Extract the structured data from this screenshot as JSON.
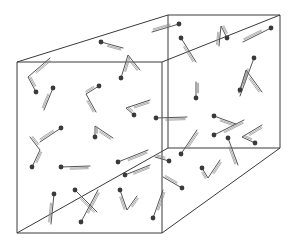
{
  "diagram": {
    "title": "",
    "colors": {
      "edge": "#3a3a3a",
      "stick": "#555555",
      "atom": "#3a3a3a",
      "background": "#ffffff"
    },
    "box": {
      "front": [
        [
          17,
          62
        ],
        [
          162,
          62
        ],
        [
          162,
          233
        ],
        [
          17,
          233
        ]
      ],
      "back": [
        [
          168,
          15
        ],
        [
          280,
          15
        ],
        [
          280,
          148
        ],
        [
          168,
          148
        ]
      ]
    },
    "molecules": [
      {
        "atom": [
          101,
          42
        ],
        "path": [
          [
            101,
            42
          ],
          [
            123,
            48
          ]
        ]
      },
      {
        "atom": [
          36,
          92
        ],
        "path": [
          [
            36,
            92
          ],
          [
            28,
            77
          ],
          [
            50,
            58
          ]
        ]
      },
      {
        "atom": [
          53,
          88
        ],
        "path": [
          [
            53,
            88
          ],
          [
            44,
            110
          ]
        ]
      },
      {
        "atom": [
          99,
          86
        ],
        "path": [
          [
            99,
            86
          ],
          [
            86,
            94
          ],
          [
            96,
            112
          ]
        ]
      },
      {
        "atom": [
          121,
          78
        ],
        "path": [
          [
            121,
            78
          ],
          [
            128,
            55
          ],
          [
            140,
            70
          ]
        ]
      },
      {
        "atom": [
          134,
          115
        ],
        "path": [
          [
            134,
            115
          ],
          [
            126,
            108
          ],
          [
            150,
            100
          ]
        ]
      },
      {
        "atom": [
          179,
          24
        ],
        "path": [
          [
            179,
            24
          ],
          [
            152,
            32
          ]
        ]
      },
      {
        "atom": [
          181,
          38
        ],
        "path": [
          [
            181,
            38
          ],
          [
            196,
            62
          ]
        ]
      },
      {
        "atom": [
          227,
          38
        ],
        "path": [
          [
            227,
            38
          ],
          [
            221,
            26
          ],
          [
            219,
            46
          ]
        ]
      },
      {
        "atom": [
          271,
          28
        ],
        "path": [
          [
            271,
            28
          ],
          [
            243,
            42
          ]
        ]
      },
      {
        "atom": [
          254,
          58
        ],
        "path": [
          [
            254,
            58
          ],
          [
            240,
            96
          ]
        ]
      },
      {
        "atom": [
          240,
          90
        ],
        "path": [
          [
            240,
            90
          ],
          [
            246,
            70
          ],
          [
            262,
            92
          ]
        ]
      },
      {
        "atom": [
          196,
          98
        ],
        "path": [
          [
            196,
            98
          ],
          [
            196,
            82
          ]
        ]
      },
      {
        "atom": [
          214,
          116
        ],
        "path": [
          [
            214,
            116
          ],
          [
            236,
            124
          ]
        ]
      },
      {
        "atom": [
          214,
          135
        ],
        "path": [
          [
            214,
            135
          ],
          [
            244,
            120
          ]
        ]
      },
      {
        "atom": [
          156,
          118
        ],
        "path": [
          [
            156,
            118
          ],
          [
            187,
            117
          ]
        ]
      },
      {
        "atom": [
          61,
          128
        ],
        "path": [
          [
            61,
            128
          ],
          [
            40,
            142
          ]
        ]
      },
      {
        "atom": [
          95,
          137
        ],
        "path": [
          [
            95,
            137
          ],
          [
            95,
            126
          ],
          [
            113,
            138
          ]
        ]
      },
      {
        "atom": [
          32,
          167
        ],
        "path": [
          [
            32,
            167
          ],
          [
            40,
            150
          ],
          [
            30,
            137
          ]
        ]
      },
      {
        "atom": [
          61,
          167
        ],
        "path": [
          [
            61,
            167
          ],
          [
            90,
            166
          ]
        ]
      },
      {
        "atom": [
          118,
          162
        ],
        "path": [
          [
            118,
            162
          ],
          [
            148,
            150
          ]
        ]
      },
      {
        "atom": [
          125,
          175
        ],
        "path": [
          [
            125,
            175
          ],
          [
            150,
            165
          ]
        ]
      },
      {
        "atom": [
          54,
          194
        ],
        "path": [
          [
            54,
            194
          ],
          [
            51,
            224
          ]
        ]
      },
      {
        "atom": [
          75,
          190
        ],
        "path": [
          [
            75,
            190
          ],
          [
            97,
            212
          ]
        ]
      },
      {
        "atom": [
          81,
          222
        ],
        "path": [
          [
            81,
            222
          ],
          [
            98,
            190
          ]
        ]
      },
      {
        "atom": [
          120,
          190
        ],
        "path": [
          [
            120,
            190
          ],
          [
            127,
            210
          ],
          [
            137,
            196
          ]
        ]
      },
      {
        "atom": [
          153,
          218
        ],
        "path": [
          [
            153,
            218
          ],
          [
            163,
            190
          ]
        ]
      },
      {
        "atom": [
          181,
          154
        ],
        "path": [
          [
            181,
            154
          ],
          [
            197,
            130
          ]
        ]
      },
      {
        "atom": [
          169,
          161
        ],
        "path": [
          [
            169,
            161
          ],
          [
            155,
            157
          ]
        ]
      },
      {
        "atom": [
          182,
          188
        ],
        "path": [
          [
            182,
            188
          ],
          [
            163,
            177
          ]
        ]
      },
      {
        "atom": [
          202,
          168
        ],
        "path": [
          [
            202,
            168
          ],
          [
            208,
            178
          ],
          [
            220,
            160
          ]
        ]
      },
      {
        "atom": [
          228,
          138
        ],
        "path": [
          [
            228,
            138
          ],
          [
            238,
            165
          ]
        ]
      },
      {
        "atom": [
          255,
          143
        ],
        "path": [
          [
            255,
            143
          ],
          [
            242,
            137
          ],
          [
            262,
            125
          ]
        ]
      }
    ]
  }
}
